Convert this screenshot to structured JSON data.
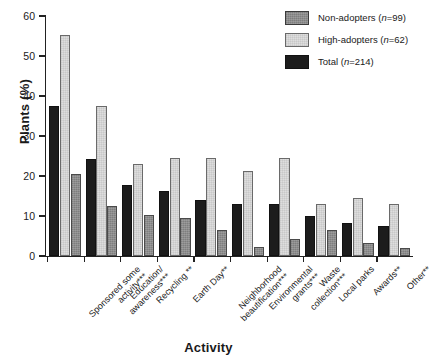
{
  "chart_data": {
    "type": "bar",
    "title": "",
    "xlabel": "Activity",
    "ylabel": "Plants (%)",
    "ylim": [
      0,
      60
    ],
    "yticks": [
      0,
      10,
      20,
      30,
      40,
      50,
      60
    ],
    "grid": false,
    "legend_position": "top-right",
    "categories": [
      "Sponsored some activity***",
      "Education/ awareness***",
      "Recycling **",
      "Earth Day**",
      "Neighborhood beautification***",
      "Environmental grants***",
      "Waste collection***",
      "Local parks",
      "Awards**",
      "Other**"
    ],
    "series": [
      {
        "name": "Total (n=214)",
        "key": "total",
        "color": "#1c1c1c",
        "values": [
          37.5,
          24.2,
          17.8,
          16.3,
          14.0,
          12.9,
          12.9,
          10.0,
          8.2,
          7.6
        ]
      },
      {
        "name": "High-adopters (n=62)",
        "key": "high",
        "color": "#dedede",
        "values": [
          55.2,
          37.6,
          22.9,
          24.6,
          24.6,
          21.2,
          24.6,
          13.0,
          14.6,
          12.9
        ]
      },
      {
        "name": "Non-adopters (n=99)",
        "key": "non",
        "color": "#8c8c8c",
        "values": [
          20.5,
          12.4,
          10.3,
          9.4,
          6.5,
          2.2,
          4.3,
          6.4,
          3.2,
          2.1
        ]
      }
    ]
  },
  "legend": {
    "items": [
      {
        "label": "Non-adopters (n=99)",
        "swatch": "non"
      },
      {
        "label": "High-adopters (n=62)",
        "swatch": "high"
      },
      {
        "label": "Total (n=214)",
        "swatch": "total"
      }
    ]
  },
  "axes": {
    "y_title": "Plants (%)",
    "x_title": "Activity",
    "y_tick_labels": [
      "0",
      "10",
      "20",
      "30",
      "40",
      "50",
      "60"
    ]
  }
}
